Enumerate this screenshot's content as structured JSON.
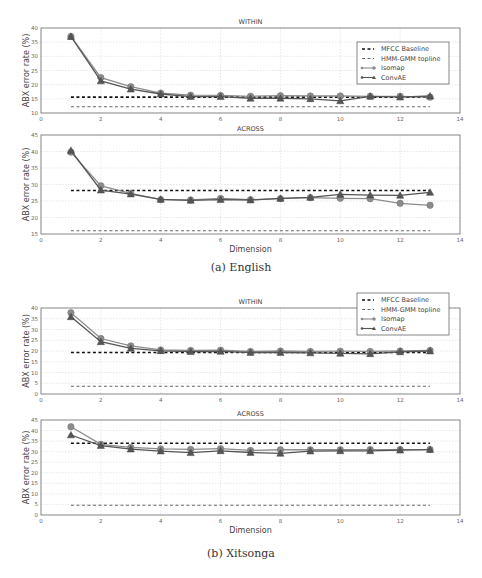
{
  "captions": {
    "english": "(a) English",
    "xitsonga": "(b) Xitsonga"
  },
  "legend": {
    "mfcc": "MFCC Baseline",
    "hmm": "HMM-GMM topline",
    "isomap": "Isomap",
    "convae": "ConvAE"
  },
  "colors": {
    "mfcc": "#111111",
    "hmm": "#666666",
    "isomap": "#8c8c8c",
    "convae": "#555555",
    "grid": "#d9d9d9",
    "axis": "#666666"
  },
  "chart_data": [
    {
      "id": "english-within",
      "group": "(a) English",
      "type": "line",
      "title": "WITHIN",
      "xlabel": "",
      "ylabel": "ABX error rate (%)",
      "xlim": [
        0,
        14
      ],
      "ylim": [
        10,
        40
      ],
      "xticks": [
        0,
        2,
        4,
        6,
        8,
        10,
        12,
        14
      ],
      "yticks": [
        10,
        15,
        20,
        25,
        30,
        35,
        40
      ],
      "grid": true,
      "legend_position": "upper right",
      "x": [
        1,
        2,
        3,
        4,
        5,
        6,
        7,
        8,
        9,
        10,
        11,
        12,
        13
      ],
      "series": [
        {
          "name": "MFCC Baseline",
          "style": "dashed-thick",
          "values": [
            15.6,
            15.6,
            15.6,
            15.6,
            15.6,
            15.6,
            15.6,
            15.6,
            15.6,
            15.6,
            15.6,
            15.6,
            15.6
          ]
        },
        {
          "name": "HMM-GMM topline",
          "style": "dashed-thin",
          "values": [
            12.2,
            12.2,
            12.2,
            12.2,
            12.2,
            12.2,
            12.2,
            12.2,
            12.2,
            12.2,
            12.2,
            12.2,
            12.2
          ]
        },
        {
          "name": "Isomap",
          "marker": "circle",
          "values": [
            37.0,
            22.5,
            19.3,
            17.0,
            16.3,
            16.2,
            15.9,
            16.1,
            16.0,
            16.0,
            15.9,
            15.9,
            15.6
          ]
        },
        {
          "name": "ConvAE",
          "marker": "triangle",
          "values": [
            37.0,
            21.3,
            18.4,
            16.7,
            15.8,
            15.8,
            15.2,
            15.2,
            15.0,
            14.3,
            15.9,
            15.6,
            16.0
          ]
        }
      ]
    },
    {
      "id": "english-across",
      "group": "(a) English",
      "type": "line",
      "title": "ACROSS",
      "xlabel": "Dimension",
      "ylabel": "ABX error rate (%)",
      "xlim": [
        0,
        14
      ],
      "ylim": [
        15,
        45
      ],
      "xticks": [
        0,
        2,
        4,
        6,
        8,
        10,
        12,
        14
      ],
      "yticks": [
        15,
        20,
        25,
        30,
        35,
        40,
        45
      ],
      "grid": true,
      "x": [
        1,
        2,
        3,
        4,
        5,
        6,
        7,
        8,
        9,
        10,
        11,
        12,
        13
      ],
      "series": [
        {
          "name": "MFCC Baseline",
          "style": "dashed-thick",
          "values": [
            28.2,
            28.2,
            28.2,
            28.2,
            28.2,
            28.2,
            28.2,
            28.2,
            28.2,
            28.2,
            28.2,
            28.2,
            28.2
          ]
        },
        {
          "name": "HMM-GMM topline",
          "style": "dashed-thin",
          "values": [
            16.0,
            16.0,
            16.0,
            16.0,
            16.0,
            16.0,
            16.0,
            16.0,
            16.0,
            16.0,
            16.0,
            16.0,
            16.0
          ]
        },
        {
          "name": "Isomap",
          "marker": "circle",
          "values": [
            39.8,
            29.6,
            27.3,
            25.4,
            25.3,
            25.8,
            25.4,
            25.7,
            26.0,
            25.8,
            25.7,
            24.3,
            23.7
          ]
        },
        {
          "name": "ConvAE",
          "marker": "triangle",
          "values": [
            40.3,
            28.3,
            27.1,
            25.5,
            25.2,
            25.4,
            25.3,
            25.8,
            26.1,
            27.0,
            26.8,
            26.7,
            27.6
          ]
        }
      ]
    },
    {
      "id": "xitsonga-within",
      "group": "(b) Xitsonga",
      "type": "line",
      "title": "WITHIN",
      "xlabel": "",
      "ylabel": "ABX error rate (%)",
      "xlim": [
        0,
        14
      ],
      "ylim": [
        0,
        40
      ],
      "xticks": [
        0,
        2,
        4,
        6,
        8,
        10,
        12,
        14
      ],
      "yticks": [
        0,
        5,
        10,
        15,
        20,
        25,
        30,
        35,
        40
      ],
      "grid": true,
      "legend_position": "upper right (overlapping top)",
      "x": [
        1,
        2,
        3,
        4,
        5,
        6,
        7,
        8,
        9,
        10,
        11,
        12,
        13
      ],
      "series": [
        {
          "name": "MFCC Baseline",
          "style": "dashed-thick",
          "values": [
            19.3,
            19.3,
            19.3,
            19.3,
            19.3,
            19.3,
            19.3,
            19.3,
            19.3,
            19.3,
            19.3,
            19.3,
            19.3
          ]
        },
        {
          "name": "HMM-GMM topline",
          "style": "dashed-thin",
          "values": [
            3.6,
            3.6,
            3.6,
            3.6,
            3.6,
            3.6,
            3.6,
            3.6,
            3.6,
            3.6,
            3.6,
            3.6,
            3.6
          ]
        },
        {
          "name": "Isomap",
          "marker": "circle",
          "values": [
            37.8,
            25.8,
            22.4,
            20.5,
            20.3,
            20.4,
            19.8,
            20.0,
            19.8,
            19.9,
            19.8,
            20.0,
            20.3
          ]
        },
        {
          "name": "ConvAE",
          "marker": "triangle",
          "values": [
            35.9,
            24.3,
            21.2,
            20.1,
            19.7,
            19.8,
            19.3,
            19.3,
            19.1,
            18.9,
            18.7,
            19.6,
            20.0
          ]
        }
      ]
    },
    {
      "id": "xitsonga-across",
      "group": "(b) Xitsonga",
      "type": "line",
      "title": "ACROSS",
      "xlabel": "Dimension",
      "ylabel": "ABX error rate (%)",
      "xlim": [
        0,
        14
      ],
      "ylim": [
        0,
        45
      ],
      "xticks": [
        0,
        2,
        4,
        6,
        8,
        10,
        12,
        14
      ],
      "yticks": [
        0,
        5,
        10,
        15,
        20,
        25,
        30,
        35,
        40,
        45
      ],
      "grid": true,
      "x": [
        1,
        2,
        3,
        4,
        5,
        6,
        7,
        8,
        9,
        10,
        11,
        12,
        13
      ],
      "series": [
        {
          "name": "MFCC Baseline",
          "style": "dashed-thick",
          "values": [
            34.0,
            34.0,
            34.0,
            34.0,
            34.0,
            34.0,
            34.0,
            34.0,
            34.0,
            34.0,
            34.0,
            34.0,
            34.0
          ]
        },
        {
          "name": "HMM-GMM topline",
          "style": "dashed-thin",
          "values": [
            4.6,
            4.6,
            4.6,
            4.6,
            4.6,
            4.6,
            4.6,
            4.6,
            4.6,
            4.6,
            4.6,
            4.6,
            4.6
          ]
        },
        {
          "name": "Isomap",
          "marker": "circle",
          "values": [
            41.8,
            33.5,
            32.0,
            31.3,
            31.1,
            31.4,
            30.6,
            30.9,
            30.9,
            30.9,
            31.0,
            31.0,
            31.0
          ]
        },
        {
          "name": "ConvAE",
          "marker": "triangle",
          "values": [
            37.9,
            32.9,
            31.2,
            30.3,
            29.5,
            30.4,
            29.6,
            29.2,
            30.3,
            30.4,
            30.4,
            30.7,
            31.0
          ]
        }
      ]
    }
  ]
}
